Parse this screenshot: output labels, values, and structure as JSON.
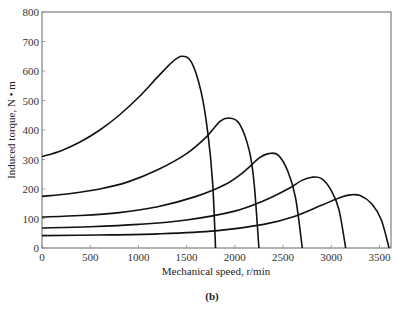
{
  "chart_data": {
    "type": "line",
    "title": "",
    "caption": "(b)",
    "xlabel": "Mechanical speed, r/min",
    "ylabel": "Induced torque, N • m",
    "xlim": [
      0,
      3620
    ],
    "ylim": [
      0,
      800
    ],
    "xticks": [
      0,
      500,
      1000,
      1500,
      2000,
      2500,
      3000,
      3500
    ],
    "yticks": [
      0,
      100,
      200,
      300,
      400,
      500,
      600,
      700,
      800
    ],
    "grid": false,
    "legend": null,
    "series": [
      {
        "name": "curve-1800",
        "x": [
          0,
          200,
          400,
          600,
          800,
          1000,
          1200,
          1350,
          1450,
          1550,
          1650,
          1720,
          1770,
          1800
        ],
        "y": [
          310,
          330,
          360,
          400,
          450,
          510,
          580,
          630,
          650,
          630,
          530,
          390,
          220,
          0
        ]
      },
      {
        "name": "curve-2250",
        "x": [
          0,
          300,
          600,
          900,
          1200,
          1500,
          1700,
          1850,
          1950,
          2050,
          2150,
          2200,
          2250
        ],
        "y": [
          175,
          185,
          200,
          225,
          265,
          320,
          375,
          430,
          440,
          420,
          330,
          220,
          0
        ]
      },
      {
        "name": "curve-2700",
        "x": [
          0,
          400,
          800,
          1200,
          1600,
          1900,
          2100,
          2250,
          2350,
          2450,
          2550,
          2630,
          2700
        ],
        "y": [
          105,
          110,
          120,
          140,
          175,
          215,
          260,
          305,
          320,
          315,
          260,
          170,
          0
        ]
      },
      {
        "name": "curve-3150",
        "x": [
          0,
          500,
          1000,
          1500,
          2000,
          2300,
          2550,
          2700,
          2800,
          2900,
          3000,
          3080,
          3150
        ],
        "y": [
          68,
          72,
          80,
          95,
          125,
          160,
          200,
          230,
          240,
          235,
          195,
          130,
          0
        ]
      },
      {
        "name": "curve-3600",
        "x": [
          0,
          600,
          1200,
          1800,
          2300,
          2600,
          2900,
          3100,
          3200,
          3300,
          3420,
          3520,
          3600
        ],
        "y": [
          42,
          44,
          48,
          58,
          80,
          105,
          145,
          172,
          180,
          178,
          150,
          95,
          0
        ]
      }
    ]
  }
}
